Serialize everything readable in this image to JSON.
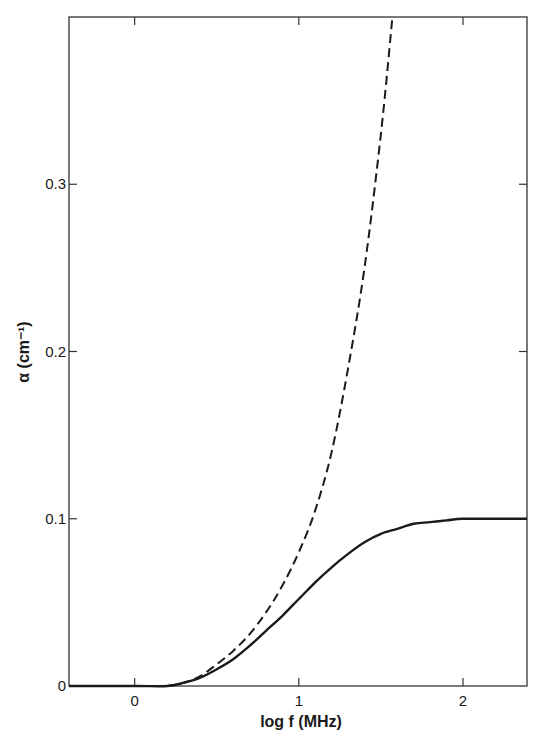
{
  "chart_data": {
    "type": "line",
    "title": "",
    "xlabel": "log f (MHz)",
    "ylabel": "α (cm⁻¹)",
    "xlim": [
      -0.4,
      2.39
    ],
    "ylim": [
      0,
      0.4
    ],
    "x_ticks": [
      {
        "value": 0,
        "label": "0"
      },
      {
        "value": 1,
        "label": "1"
      },
      {
        "value": 2,
        "label": "2"
      }
    ],
    "y_ticks": [
      {
        "value": 0,
        "label": "0"
      },
      {
        "value": 0.1,
        "label": "0.1"
      },
      {
        "value": 0.2,
        "label": "0.2"
      },
      {
        "value": 0.3,
        "label": "0.3"
      }
    ],
    "grid": false,
    "legend": null,
    "series": [
      {
        "name": "solid",
        "style": "solid",
        "color": "#1a1a1a",
        "x": [
          -0.4,
          0.0,
          0.2,
          0.3,
          0.4,
          0.5,
          0.6,
          0.7,
          0.8,
          0.9,
          1.0,
          1.1,
          1.2,
          1.3,
          1.4,
          1.5,
          1.6,
          1.7,
          1.8,
          1.9,
          2.0,
          2.2,
          2.39
        ],
        "y": [
          0,
          0,
          0,
          0.002,
          0.005,
          0.01,
          0.016,
          0.024,
          0.033,
          0.042,
          0.052,
          0.062,
          0.071,
          0.079,
          0.086,
          0.091,
          0.094,
          0.097,
          0.098,
          0.099,
          0.1,
          0.1,
          0.1
        ]
      },
      {
        "name": "dashed",
        "style": "dashed",
        "color": "#1a1a1a",
        "x": [
          0.2,
          0.3,
          0.4,
          0.5,
          0.6,
          0.7,
          0.8,
          0.9,
          1.0,
          1.1,
          1.2,
          1.3,
          1.4,
          1.5,
          1.57
        ],
        "y": [
          0,
          0.002,
          0.006,
          0.013,
          0.021,
          0.031,
          0.044,
          0.06,
          0.08,
          0.105,
          0.14,
          0.19,
          0.25,
          0.33,
          0.4
        ]
      }
    ]
  }
}
